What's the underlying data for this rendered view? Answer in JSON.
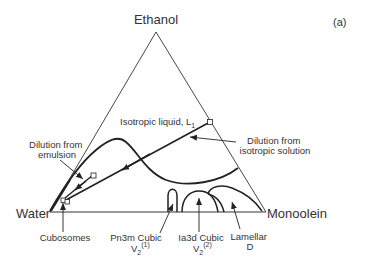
{
  "figure": {
    "panel_label": "(a)",
    "type": "ternary phase diagram"
  },
  "vertices": {
    "top": "Ethanol",
    "left": "Water",
    "right": "Monoolein"
  },
  "regions": {
    "isotropic": {
      "label": "Isotropic liquid, L",
      "subscript": "1"
    },
    "pn3m": {
      "line1": "Pn3m Cubic",
      "symbol": "V",
      "subscript": "2",
      "superscript": "(1)"
    },
    "ia3d": {
      "line1": "Ia3d Cubic",
      "symbol": "V",
      "subscript": "2",
      "superscript": "(2)"
    },
    "lamellar": {
      "line1": "Lamellar",
      "line2": "D"
    }
  },
  "annotations": {
    "dilution_emulsion": {
      "line1": "Dilution from",
      "line2": "emulsion"
    },
    "dilution_isotropic": {
      "line1": "Dilution from",
      "line2": "isotropic solution"
    },
    "cubosomes": "Cubosomes"
  },
  "colors": {
    "line": "#222222",
    "text": "#333333",
    "background": "#ffffff"
  }
}
